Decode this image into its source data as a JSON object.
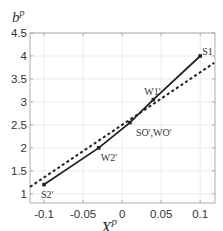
{
  "chart_data": {
    "type": "line",
    "title": "",
    "xlabel": "X^p_{1'ini}",
    "xlabel_main": "X",
    "xlabel_sup": "p",
    "xlabel_sub": "1'ini",
    "ylabel": "b^p",
    "ylabel_main": "b",
    "ylabel_sup": "p",
    "xlim": [
      -0.118,
      0.119
    ],
    "ylim": [
      0.8,
      4.5
    ],
    "grid": true,
    "legend": null,
    "x_ticks": [
      -0.1,
      -0.05,
      0,
      0.05,
      0.1
    ],
    "x_tick_labels": [
      "-0.1",
      "-0.05",
      "0",
      "0.05",
      "0.1"
    ],
    "y_ticks": [
      1,
      1.5,
      2,
      2.5,
      3,
      3.5,
      4,
      4.5
    ],
    "y_tick_labels": [
      "1",
      "1.5",
      "2",
      "2.5",
      "3",
      "3.5",
      "4",
      "4.5"
    ],
    "series": [
      {
        "name": "solid piecewise",
        "style": "solid",
        "color": "#222222",
        "marker": "square",
        "points": [
          {
            "x": -0.1,
            "y": 1.2,
            "label": "S2'"
          },
          {
            "x": -0.03,
            "y": 2.0,
            "label": "W2'"
          },
          {
            "x": 0.01,
            "y": 2.55,
            "label": "SO',WO'"
          },
          {
            "x": 0.04,
            "y": 3.05,
            "label": "W1'"
          },
          {
            "x": 0.1,
            "y": 4.0,
            "label": "S1"
          }
        ]
      },
      {
        "name": "dashed linear",
        "style": "dashed",
        "color": "#222222",
        "points": [
          {
            "x": -0.118,
            "y": 1.15
          },
          {
            "x": 0.118,
            "y": 3.85
          }
        ]
      }
    ],
    "annotations": [
      {
        "text": "S2'",
        "x": -0.1,
        "y": 1.2
      },
      {
        "text": "W2'",
        "x": -0.03,
        "y": 2.0
      },
      {
        "text": "SO',WO'",
        "x": 0.01,
        "y": 2.55
      },
      {
        "text": "W1'",
        "x": 0.04,
        "y": 3.05
      },
      {
        "text": "S1",
        "x": 0.1,
        "y": 4.0
      }
    ]
  },
  "layout": {
    "plot_box": {
      "left": 30,
      "top": 33,
      "right": 215,
      "bottom": 203
    },
    "colors": {
      "line": "#222222",
      "grid": "#e6e6e6",
      "axis": "#9a9a9a",
      "text": "#333333"
    }
  }
}
